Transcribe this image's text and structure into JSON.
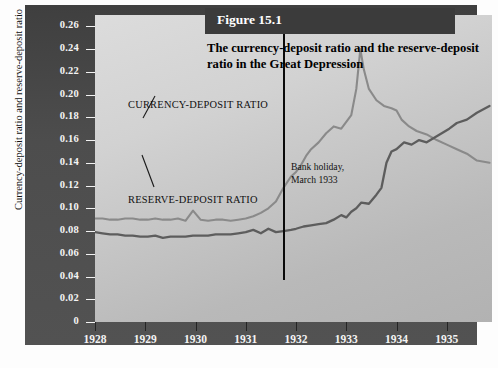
{
  "figure": {
    "badge": "Figure 15.1",
    "title_line1": "The currency-deposit ratio and the reserve-deposit",
    "title_line2": "ratio in the Great Depression"
  },
  "annotations": {
    "currency_label": "CURRENCY-DEPOSIT RATIO",
    "reserve_label": "RESERVE-DEPOSIT RATIO",
    "bank_holiday_line1": "Bank holiday,",
    "bank_holiday_line2": "March 1933"
  },
  "chart_data": {
    "type": "line",
    "title": "The currency-deposit ratio and the reserve-deposit ratio in the Great Depression",
    "xlabel": "",
    "ylabel": "Currency-deposit ratio and  reserve-deposit ratio",
    "xlim": [
      1928,
      1935.9
    ],
    "ylim": [
      0,
      0.27
    ],
    "grid": false,
    "legend": "inline-annotations",
    "xticks": [
      1928,
      1929,
      1930,
      1931,
      1932,
      1933,
      1934,
      1935
    ],
    "xticklabels": [
      "1928",
      "1929",
      "1930",
      "1931",
      "1932",
      "1933",
      "1934",
      "1935"
    ],
    "yticks": [
      0,
      0.02,
      0.04,
      0.06,
      0.08,
      0.1,
      0.12,
      0.14,
      0.16,
      0.18,
      0.2,
      0.22,
      0.24,
      0.26
    ],
    "yticklabels": [
      "0",
      "0.02",
      "0.04",
      "0.06",
      "0.08",
      "0.10",
      "0.12",
      "0.14",
      "0.16",
      "0.18",
      "0.20",
      "0.22",
      "0.24",
      "0.26"
    ],
    "annotations": [
      {
        "text": "Bank holiday, March 1933",
        "x": 1933.2,
        "type": "vline"
      }
    ],
    "series": [
      {
        "name": "CURRENCY-DEPOSIT RATIO",
        "color": "#8a8a8a",
        "x": [
          1928.0,
          1928.15,
          1928.3,
          1928.45,
          1928.6,
          1928.75,
          1928.9,
          1929.05,
          1929.2,
          1929.35,
          1929.5,
          1929.65,
          1929.8,
          1929.95,
          1930.1,
          1930.25,
          1930.4,
          1930.55,
          1930.7,
          1930.85,
          1931.0,
          1931.15,
          1931.3,
          1931.45,
          1931.6,
          1931.75,
          1931.9,
          1932.0,
          1932.1,
          1932.2,
          1932.3,
          1932.45,
          1932.6,
          1932.75,
          1932.9,
          1933.0,
          1933.1,
          1933.2,
          1933.28,
          1933.35,
          1933.45,
          1933.6,
          1933.75,
          1933.9,
          1934.0,
          1934.1,
          1934.25,
          1934.4,
          1934.6,
          1934.8,
          1935.0,
          1935.2,
          1935.4,
          1935.6,
          1935.85
        ],
        "y": [
          0.091,
          0.091,
          0.09,
          0.09,
          0.091,
          0.091,
          0.09,
          0.09,
          0.091,
          0.09,
          0.09,
          0.091,
          0.089,
          0.098,
          0.09,
          0.089,
          0.09,
          0.09,
          0.089,
          0.09,
          0.091,
          0.093,
          0.096,
          0.1,
          0.106,
          0.118,
          0.128,
          0.132,
          0.138,
          0.146,
          0.152,
          0.158,
          0.166,
          0.172,
          0.17,
          0.176,
          0.182,
          0.205,
          0.24,
          0.222,
          0.205,
          0.195,
          0.19,
          0.188,
          0.186,
          0.178,
          0.172,
          0.168,
          0.165,
          0.16,
          0.156,
          0.152,
          0.148,
          0.142,
          0.14
        ]
      },
      {
        "name": "RESERVE-DEPOSIT RATIO",
        "color": "#5d5d5d",
        "x": [
          1928.0,
          1928.15,
          1928.3,
          1928.45,
          1928.6,
          1928.75,
          1928.9,
          1929.05,
          1929.2,
          1929.35,
          1929.5,
          1929.65,
          1929.8,
          1929.95,
          1930.1,
          1930.25,
          1930.4,
          1930.55,
          1930.7,
          1930.85,
          1931.0,
          1931.15,
          1931.3,
          1931.45,
          1931.6,
          1931.75,
          1931.9,
          1932.0,
          1932.15,
          1932.3,
          1932.45,
          1932.6,
          1932.75,
          1932.9,
          1933.0,
          1933.1,
          1933.2,
          1933.3,
          1933.45,
          1933.6,
          1933.7,
          1933.8,
          1933.9,
          1934.0,
          1934.15,
          1934.3,
          1934.45,
          1934.6,
          1934.75,
          1934.9,
          1935.05,
          1935.2,
          1935.4,
          1935.6,
          1935.85
        ],
        "y": [
          0.079,
          0.078,
          0.077,
          0.077,
          0.076,
          0.076,
          0.075,
          0.075,
          0.076,
          0.074,
          0.075,
          0.075,
          0.075,
          0.076,
          0.076,
          0.076,
          0.077,
          0.077,
          0.077,
          0.078,
          0.079,
          0.081,
          0.078,
          0.082,
          0.079,
          0.08,
          0.081,
          0.082,
          0.084,
          0.085,
          0.086,
          0.087,
          0.09,
          0.094,
          0.092,
          0.097,
          0.1,
          0.105,
          0.104,
          0.112,
          0.118,
          0.14,
          0.15,
          0.152,
          0.158,
          0.156,
          0.16,
          0.158,
          0.162,
          0.166,
          0.17,
          0.175,
          0.178,
          0.184,
          0.19
        ]
      }
    ]
  }
}
